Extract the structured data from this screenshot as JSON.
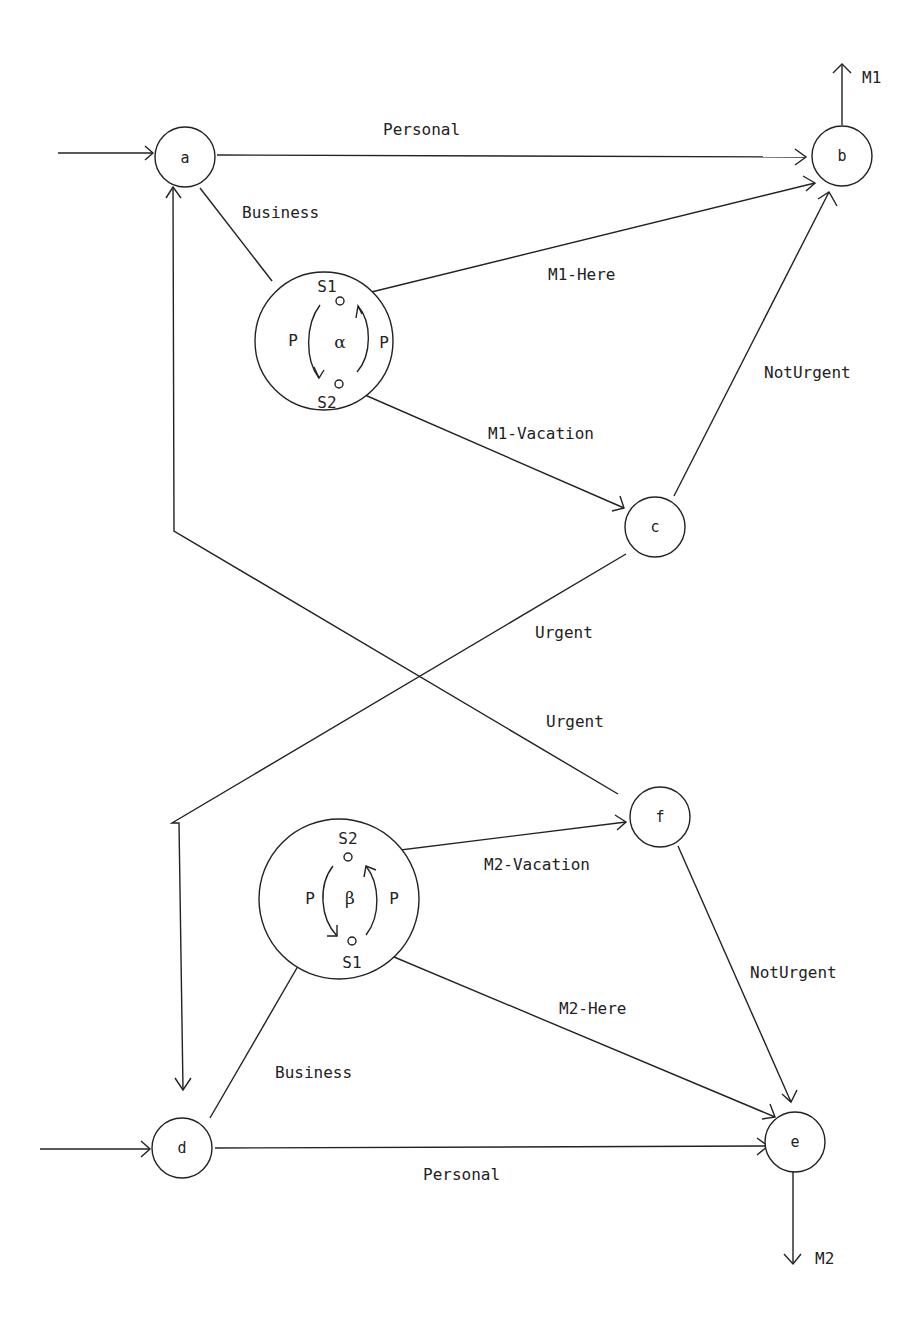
{
  "diagram": {
    "nodes": [
      {
        "id": "a",
        "label": "a"
      },
      {
        "id": "b",
        "label": "b"
      },
      {
        "id": "c",
        "label": "c"
      },
      {
        "id": "d",
        "label": "d"
      },
      {
        "id": "e",
        "label": "e"
      },
      {
        "id": "f",
        "label": "f"
      }
    ],
    "supernodes": {
      "alpha": {
        "symbol": "α",
        "top_state": "S1",
        "bottom_state": "S2",
        "left_label": "P",
        "right_label": "P"
      },
      "beta": {
        "symbol": "β",
        "top_state": "S2",
        "bottom_state": "S1",
        "left_label": "P",
        "right_label": "P"
      }
    },
    "edges": {
      "a_b": "Personal",
      "a_alpha": "Business",
      "alpha_b": "M1-Here",
      "alpha_c": "M1-Vacation",
      "c_b": "NotUrgent",
      "c_d": "Urgent",
      "f_a": "Urgent",
      "d_beta": "Business",
      "beta_f": "M2-Vacation",
      "beta_e": "M2-Here",
      "f_e": "NotUrgent",
      "d_e": "Personal"
    },
    "outputs": {
      "b_out": "M1",
      "e_out": "M2"
    }
  }
}
